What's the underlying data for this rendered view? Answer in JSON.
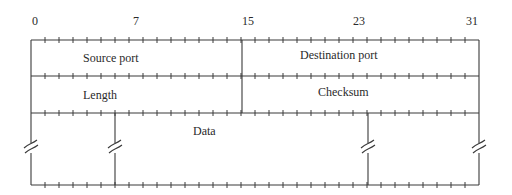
{
  "bit_labels": [
    {
      "text": "0",
      "x": 35
    },
    {
      "text": "7",
      "x": 136
    },
    {
      "text": "15",
      "x": 248
    },
    {
      "text": "23",
      "x": 359
    },
    {
      "text": "31",
      "x": 472
    }
  ],
  "fields": {
    "source_port": "Source port",
    "destination_port": "Destination port",
    "length": "Length",
    "checksum": "Checksum",
    "data": "Data"
  },
  "colors": {
    "line": "#3a3a3a",
    "text": "#2a2a2a"
  }
}
